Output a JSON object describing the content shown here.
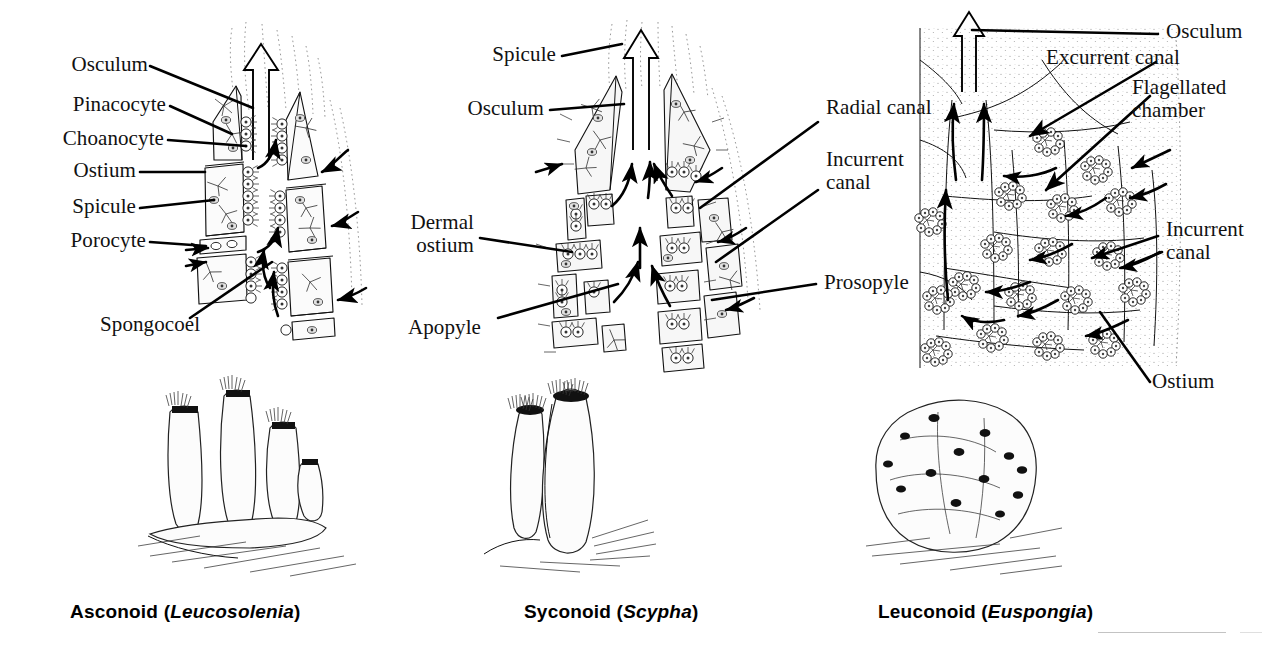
{
  "figure": {
    "background": "#ffffff",
    "ink": "#111111"
  },
  "panels": [
    {
      "id": "asconoid",
      "caption_prefix": "Asconoid (",
      "caption_genus": "Leucosolenia",
      "caption_suffix": ")",
      "labels": [
        {
          "key": "osculum",
          "text": "Osculum"
        },
        {
          "key": "pinacocyte",
          "text": "Pinacocyte"
        },
        {
          "key": "choanocyte",
          "text": "Choanocyte"
        },
        {
          "key": "ostium",
          "text": "Ostium"
        },
        {
          "key": "spicule",
          "text": "Spicule"
        },
        {
          "key": "porocyte",
          "text": "Porocyte"
        },
        {
          "key": "spongocoel",
          "text": "Spongocoel"
        }
      ]
    },
    {
      "id": "syconoid",
      "caption_prefix": "Syconoid (",
      "caption_genus": "Scypha",
      "caption_suffix": ")",
      "labels": [
        {
          "key": "spicule",
          "text": "Spicule"
        },
        {
          "key": "osculum",
          "text": "Osculum"
        },
        {
          "key": "dermal_ostium",
          "text": "Dermal\nostium"
        },
        {
          "key": "apopyle",
          "text": "Apopyle"
        },
        {
          "key": "radial_canal",
          "text": "Radial canal"
        },
        {
          "key": "incurrent_canal",
          "text": "Incurrent\ncanal"
        },
        {
          "key": "prosopyle",
          "text": "Prosopyle"
        }
      ]
    },
    {
      "id": "leuconoid",
      "caption_prefix": "Leuconoid (",
      "caption_genus": "Euspongia",
      "caption_suffix": ")",
      "labels": [
        {
          "key": "osculum",
          "text": "Osculum"
        },
        {
          "key": "excurrent_canal",
          "text": "Excurrent canal"
        },
        {
          "key": "flagellated_chamber",
          "text": "Flagellated\nchamber"
        },
        {
          "key": "incurrent_canal",
          "text": "Incurrent\ncanal"
        },
        {
          "key": "ostium",
          "text": "Ostium"
        }
      ]
    }
  ]
}
